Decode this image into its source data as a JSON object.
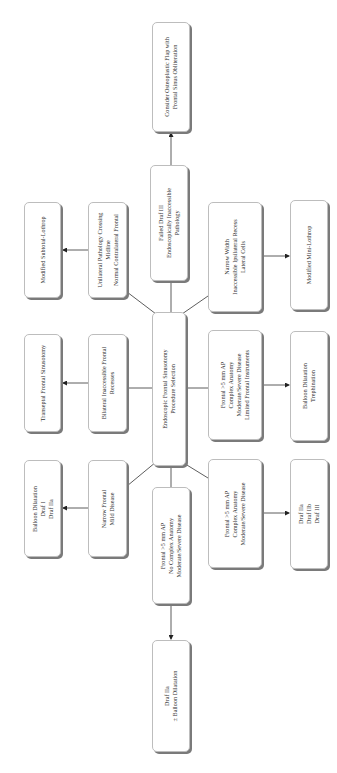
{
  "diagram": {
    "orientation": "rotated -90deg (reads bottom-to-top)",
    "root": {
      "label": [
        "Endoscopic Frontal Sinusotomy",
        "Procedure Selection"
      ]
    },
    "conditions": [
      {
        "id": "c1",
        "label": [
          "Narrow Frontal",
          "Mild Disease"
        ]
      },
      {
        "id": "c2",
        "label": [
          "Bilateral Inaccessible Frontal",
          "Recesses"
        ]
      },
      {
        "id": "c3",
        "label": [
          "Unilateral Pathology Crossing",
          "Midline",
          "Normal Contralateral Frontal"
        ]
      },
      {
        "id": "c4",
        "label": [
          "Failed Draf III",
          "Endoscopically Inaccessible",
          "Pathology"
        ]
      },
      {
        "id": "c5",
        "label": [
          "Narrow Width",
          "Inaccessible Ipsilateral Recess",
          "Lateral Cells"
        ]
      },
      {
        "id": "c6",
        "label": [
          "Frontal >5 mm AP",
          "Complex Anatomy",
          "Moderate/Severe Disease",
          "Limited Frontal Instruments"
        ]
      },
      {
        "id": "c7",
        "label": [
          "Frontal >5 mm AP",
          "Complex Anatomy",
          "Moderate/Severe Disease"
        ]
      },
      {
        "id": "c8",
        "label": [
          "Frontal >5 mm AP",
          "No Complex Anatomy",
          "Moderate/Severe Disease"
        ]
      }
    ],
    "procedures": [
      {
        "id": "p1",
        "from": "c1",
        "label": [
          "Balloon Dilatation",
          "Draf I",
          "Draf IIa"
        ]
      },
      {
        "id": "p2",
        "from": "c2",
        "label": [
          "Transeptal Frontal Sinusotomy"
        ]
      },
      {
        "id": "p3",
        "from": "c3",
        "label": [
          "Modified Subtotal-Lothrop"
        ]
      },
      {
        "id": "p4",
        "from": "c4",
        "label": [
          "Consider Osteoplastic Flap with",
          "Frontal Sinus Obliteration"
        ]
      },
      {
        "id": "p5",
        "from": "c5",
        "label": [
          "Modified Mini-Lothrop"
        ]
      },
      {
        "id": "p6",
        "from": "c6",
        "label": [
          "Balloon Dilatation",
          "Trephination"
        ]
      },
      {
        "id": "p7",
        "from": "c7",
        "label": [
          "Draf IIa",
          "Draf IIb",
          "Draf III"
        ]
      },
      {
        "id": "p8",
        "from": "c8",
        "label": [
          "Draf IIa",
          "± Balloon Dilatation"
        ]
      }
    ]
  },
  "text": {
    "root_l1": "Endoscopic Frontal Sinusotomy",
    "root_l2": "Procedure Selection",
    "c1_l1": "Narrow Frontal",
    "c1_l2": "Mild Disease",
    "c2_l1": "Bilateral Inaccessible Frontal",
    "c2_l2": "Recesses",
    "c3_l1": "Unilateral Pathology Crossing",
    "c3_l2": "Midline",
    "c3_l3": "Normal Contralateral Frontal",
    "c4_l1": "Failed Draf III",
    "c4_l2": "Endoscopically Inaccessible",
    "c4_l3": "Pathology",
    "c5_l1": "Narrow Width",
    "c5_l2": "Inaccessible Ipsilateral Recess",
    "c5_l3": "Lateral Cells",
    "c6_l1": "Frontal >5 mm AP",
    "c6_l2": "Complex Anatomy",
    "c6_l3": "Moderate/Severe Disease",
    "c6_l4": "Limited Frontal Instruments",
    "c7_l1": "Frontal >5 mm AP",
    "c7_l2": "Complex Anatomy",
    "c7_l3": "Moderate/Severe Disease",
    "c8_l1": "Frontal >5 mm AP",
    "c8_l2": "No Complex Anatomy",
    "c8_l3": "Moderate/Severe Disease",
    "p1_l1": "Balloon Dilatation",
    "p1_l2": "Draf I",
    "p1_l3": "Draf IIa",
    "p2_l1": "Transeptal Frontal Sinusotomy",
    "p3_l1": "Modified Subtotal-Lothrop",
    "p4_l1": "Consider Osteoplastic Flap with",
    "p4_l2": "Frontal Sinus Obliteration",
    "p5_l1": "Modified Mini-Lothrop",
    "p6_l1": "Balloon Dilatation",
    "p6_l2": "Trephination",
    "p7_l1": "Draf IIa",
    "p7_l2": "Draf IIb",
    "p7_l3": "Draf III",
    "p8_l1": "Draf IIa",
    "p8_l2": "± Balloon Dilatation"
  },
  "colors": {
    "border": "#bdbdbd",
    "shadow": "#7a7a7a",
    "line": "#333333",
    "text": "#333333",
    "background": "#ffffff"
  }
}
